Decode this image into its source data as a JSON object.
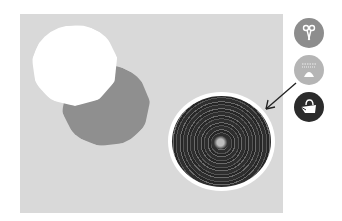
{
  "canvas": {
    "background_color": "#d9d9d9",
    "shapes": [
      {
        "type": "circle",
        "fill": "#ffffff",
        "label": "white-blob"
      },
      {
        "type": "circle",
        "fill": "#8f8f8f",
        "label": "gray-blob"
      },
      {
        "type": "scribble-circle",
        "fill": "#2e2e2e",
        "label": "dark-scribble"
      }
    ],
    "arrow": {
      "color": "#222222"
    }
  },
  "toolbar": {
    "tools": [
      {
        "name": "scissors",
        "icon": "scissors-icon",
        "color": "#8d8d8d"
      },
      {
        "name": "stamp",
        "icon": "stamp-icon",
        "color": "#b5b5b5"
      },
      {
        "name": "fill-bucket",
        "icon": "paint-bucket-icon",
        "color": "#2b2b2b",
        "selected": true
      }
    ]
  }
}
